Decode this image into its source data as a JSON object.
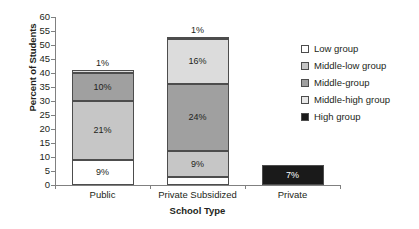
{
  "chart_data": {
    "type": "bar",
    "subtype": "stacked-bar",
    "title": "",
    "xlabel": "School Type",
    "ylabel": "Percent of Students",
    "ylim": [
      0,
      60
    ],
    "ytick_step": 5,
    "yticks": [
      0,
      5,
      10,
      15,
      20,
      25,
      30,
      35,
      40,
      45,
      50,
      55,
      60
    ],
    "grid": false,
    "legend_position": "right",
    "categories": [
      "Public",
      "Private Subsidized",
      "Private"
    ],
    "series": [
      {
        "name": "Low group",
        "color": "#ffffff",
        "label_color": "dark",
        "values": [
          9,
          3,
          0
        ],
        "labels": [
          "9%",
          "3%",
          ""
        ]
      },
      {
        "name": "Middle-low group",
        "color": "#c6c6c6",
        "label_color": "dark",
        "values": [
          21,
          9,
          0
        ],
        "labels": [
          "21%",
          "9%",
          ""
        ]
      },
      {
        "name": "Middle-group",
        "color": "#a0a0a0",
        "label_color": "dark",
        "values": [
          10,
          24,
          0
        ],
        "labels": [
          "10%",
          "24%",
          ""
        ]
      },
      {
        "name": "Middle-high group",
        "color": "#dcdcdc",
        "label_color": "dark",
        "values": [
          1,
          16,
          0
        ],
        "labels": [
          "1%",
          "16%",
          ""
        ]
      },
      {
        "name": "High group",
        "color": "#1a1a1a",
        "label_color": "light",
        "values": [
          0,
          1,
          7
        ],
        "labels": [
          "",
          "1%",
          "7%"
        ]
      }
    ],
    "totals": [
      41,
      53,
      7
    ],
    "outside_labels": [
      {
        "category": "Public",
        "text": "1%"
      },
      {
        "category": "Private Subsidized",
        "text": "1%"
      }
    ]
  },
  "legend": {
    "items": [
      {
        "label": "Low group",
        "color": "#ffffff"
      },
      {
        "label": "Middle-low group",
        "color": "#c6c6c6"
      },
      {
        "label": "Middle-group",
        "color": "#a0a0a0"
      },
      {
        "label": "Middle-high group",
        "color": "#e8e8e8"
      },
      {
        "label": "High group",
        "color": "#1a1a1a"
      }
    ]
  },
  "axis": {
    "y_title": "Percent of Students",
    "x_title": "School Type",
    "y_tick_labels": [
      "60",
      "55",
      "50",
      "45",
      "40",
      "35",
      "30",
      "25",
      "20",
      "15",
      "10",
      "5",
      "0"
    ],
    "x_tick_labels": [
      "Public",
      "Private Subsidized",
      "Private"
    ]
  }
}
